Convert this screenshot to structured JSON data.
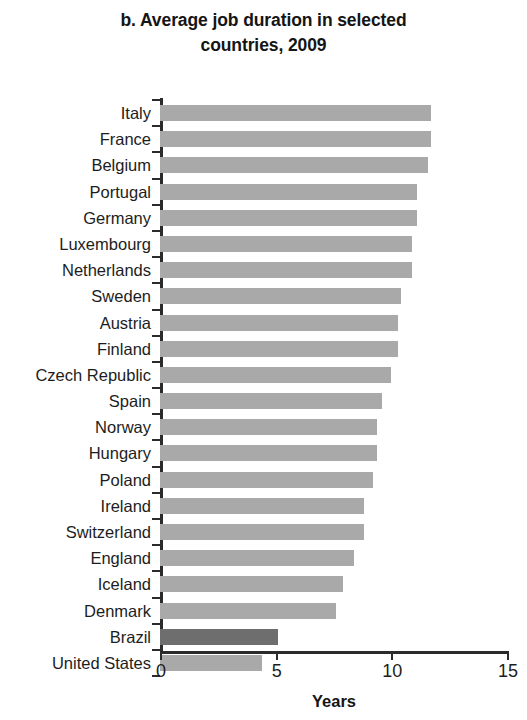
{
  "title": {
    "line1": "b. Average job duration in selected",
    "line2": "countries, 2009"
  },
  "axis": {
    "x_title": "Years",
    "ticks": [
      "0",
      "5",
      "10",
      "15"
    ],
    "tick_values": [
      0,
      5,
      10,
      15
    ]
  },
  "colors": {
    "bar": "#a9a9a9",
    "bar_highlight": "#6e6e6e",
    "axis": "#2b2b2b",
    "text": "#1d1d1d",
    "background": "#ffffff"
  },
  "chart_data": {
    "type": "bar",
    "orientation": "horizontal",
    "title": "b. Average job duration in selected countries, 2009",
    "xlabel": "Years",
    "ylabel": "",
    "xlim": [
      0,
      15
    ],
    "grid": false,
    "legend": null,
    "categories": [
      "Italy",
      "France",
      "Belgium",
      "Portugal",
      "Germany",
      "Luxembourg",
      "Netherlands",
      "Sweden",
      "Austria",
      "Finland",
      "Czech Republic",
      "Spain",
      "Norway",
      "Hungary",
      "Poland",
      "Ireland",
      "Switzerland",
      "England",
      "Iceland",
      "Denmark",
      "Brazil",
      "United States"
    ],
    "values": [
      11.7,
      11.7,
      11.6,
      11.1,
      11.1,
      10.9,
      10.9,
      10.4,
      10.3,
      10.3,
      10.0,
      9.6,
      9.4,
      9.4,
      9.2,
      8.8,
      8.8,
      8.4,
      7.9,
      7.6,
      5.1,
      4.4
    ],
    "highlighted_categories": [
      "Brazil"
    ]
  }
}
